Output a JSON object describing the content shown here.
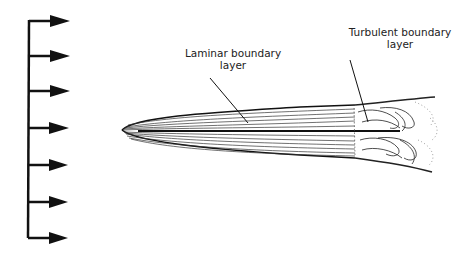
{
  "diagram": {
    "labels": {
      "laminar_line1": "Laminar boundary",
      "laminar_line2": "layer",
      "turbulent_line1": "Turbulent boundary",
      "turbulent_line2": "layer"
    },
    "free_stream_arrows": 7,
    "colors": {
      "ink": "#111111",
      "background": "#ffffff"
    }
  }
}
